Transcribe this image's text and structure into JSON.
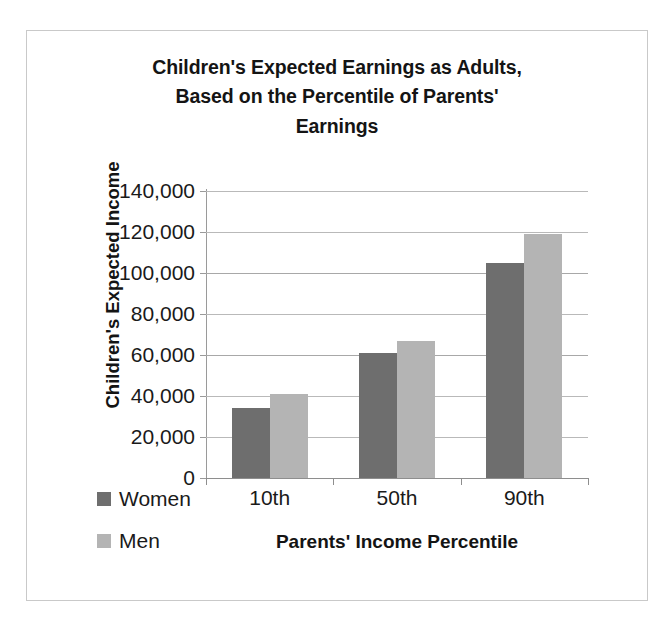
{
  "chart_data": {
    "type": "bar",
    "title": "Children's Expected Earnings as Adults, Based on the Percentile of Parents' Earnings",
    "title_lines": [
      "Children's Expected Earnings as Adults,",
      "Based on the Percentile of Parents'",
      "Earnings"
    ],
    "xlabel": "Parents' Income Percentile",
    "ylabel": "Children's Expected Income",
    "categories": [
      "10th",
      "50th",
      "90th"
    ],
    "series": [
      {
        "name": "Women",
        "color": "#6e6e6e",
        "values": [
          34000,
          61000,
          105000
        ]
      },
      {
        "name": "Men",
        "color": "#b4b4b4",
        "values": [
          41000,
          67000,
          119000
        ]
      }
    ],
    "ylim": [
      0,
      140000
    ],
    "ytick_step": 20000,
    "ytick_labels": [
      "140,000",
      "120,000",
      "100,000",
      "80,000",
      "60,000",
      "40,000",
      "20,000",
      "0"
    ],
    "ytick_values": [
      140000,
      120000,
      100000,
      80000,
      60000,
      40000,
      20000,
      0
    ],
    "grid": true,
    "legend_position": "bottom-left",
    "legend": [
      {
        "label": "Women",
        "color": "#6e6e6e"
      },
      {
        "label": "Men",
        "color": "#b4b4b4"
      }
    ]
  }
}
